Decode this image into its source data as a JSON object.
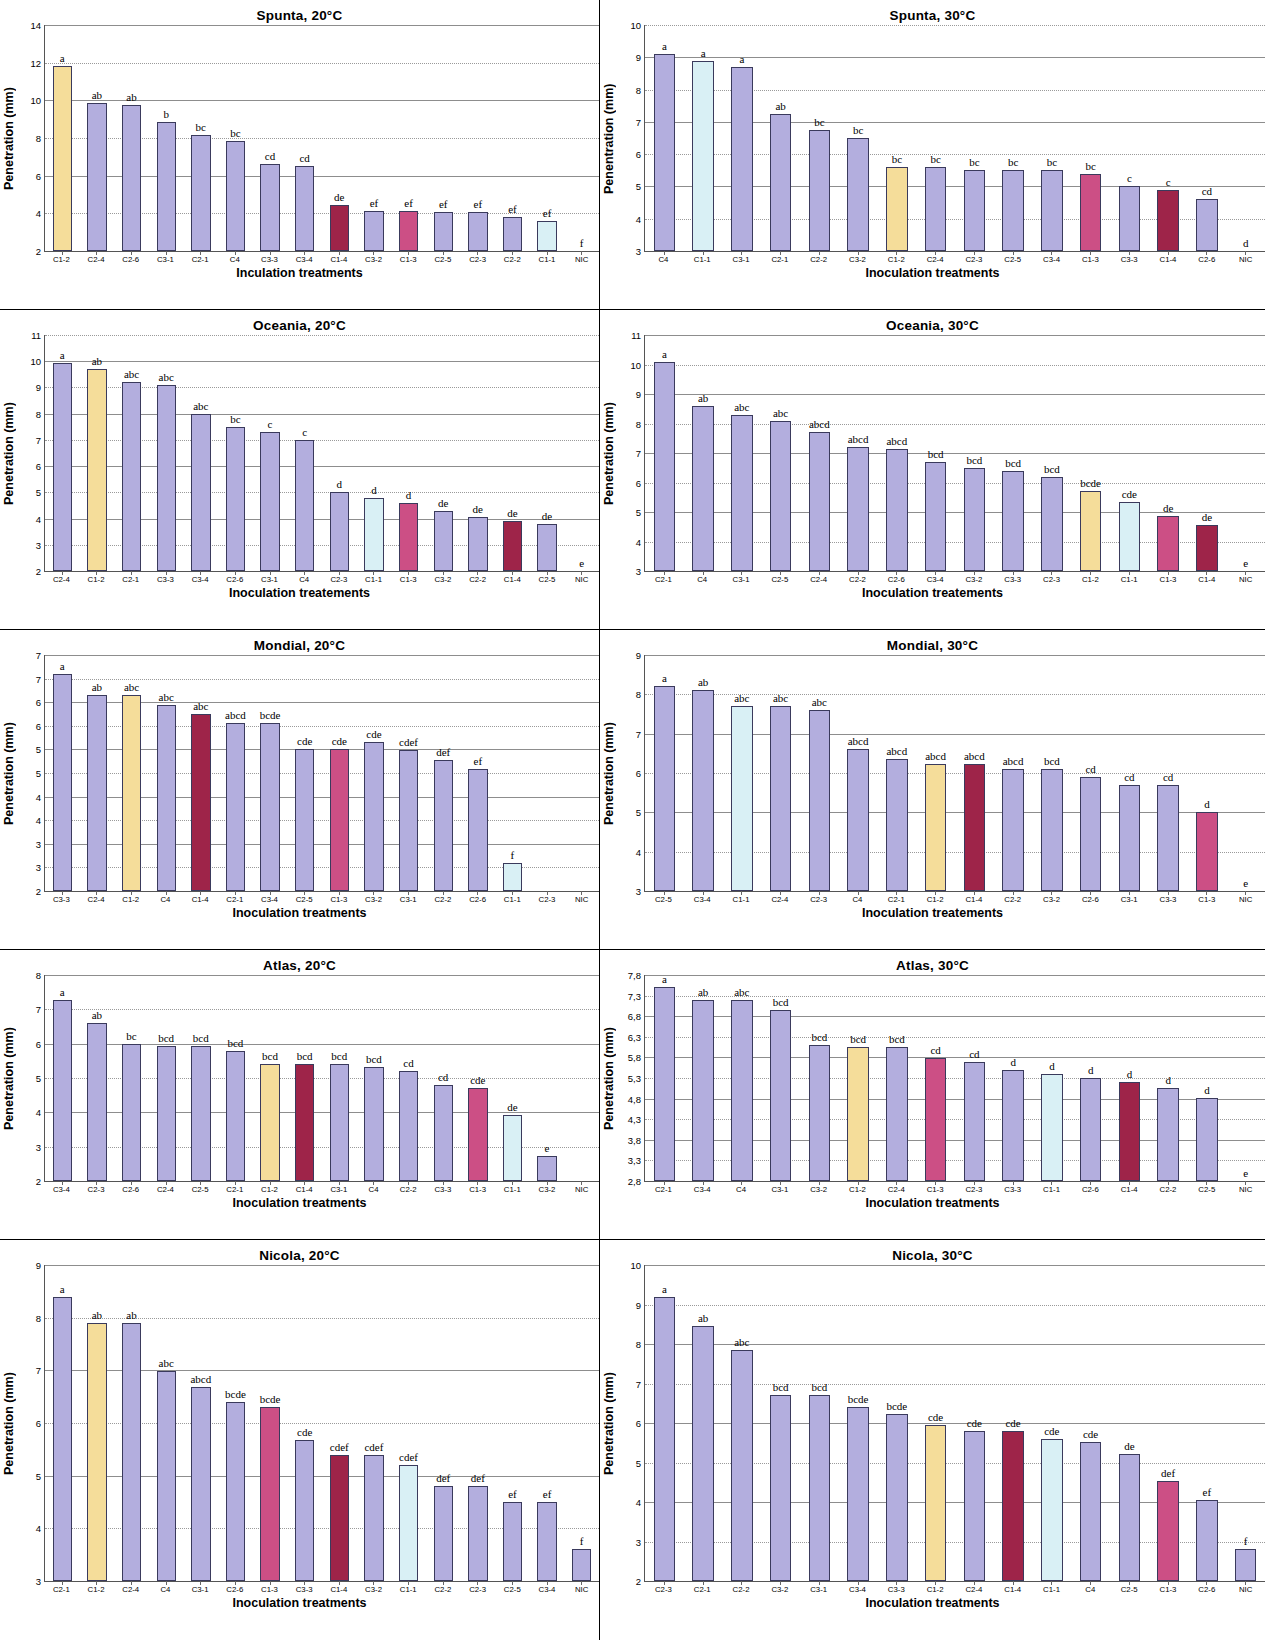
{
  "figure": {
    "xaxis_title_default": "Inoculation treatments",
    "yaxis_title_default": "Penetration (mm)",
    "colors": {
      "default_bar": "#b3aede",
      "yellow_bar": "#f5dd9a",
      "pale_blue_bar": "#d9f0f5",
      "pink_bar": "#cc4f85",
      "dark_red_bar": "#9e2449",
      "bar_border": "#3a3a5c",
      "gridline": "#9a9a9a"
    }
  },
  "chart_data": [
    {
      "id": "spunta-20",
      "type": "bar",
      "title": "Spunta, 20°C",
      "xlabel": "Inculation treatments",
      "ylabel": "Penetration (mm)",
      "ylim": [
        2,
        14
      ],
      "yticks": [
        "2",
        "4",
        "6",
        "8",
        "10",
        "12",
        "14"
      ],
      "ytickvals": [
        2,
        4,
        6,
        8,
        10,
        12,
        14
      ],
      "categories": [
        "C1-2",
        "C2-4",
        "C2-6",
        "C3-1",
        "C2-1",
        "C4",
        "C3-3",
        "C3-4",
        "C1-4",
        "C3-2",
        "C1-3",
        "C2-5",
        "C2-3",
        "C2-2",
        "C1-1",
        "NIC"
      ],
      "values": [
        11.85,
        9.85,
        9.75,
        8.85,
        8.15,
        7.85,
        6.6,
        6.5,
        4.45,
        4.1,
        4.15,
        4.05,
        4.05,
        3.8,
        3.6,
        2.0
      ],
      "labels": [
        "a",
        "ab",
        "ab",
        "b",
        "bc",
        "bc",
        "cd",
        "cd",
        "de",
        "ef",
        "ef",
        "ef",
        "ef",
        "ef",
        "ef",
        "f"
      ],
      "bar_colors": [
        "yellow",
        "default",
        "default",
        "default",
        "default",
        "default",
        "default",
        "default",
        "darkred",
        "default",
        "pink",
        "default",
        "default",
        "default",
        "paleblue",
        "none"
      ]
    },
    {
      "id": "spunta-30",
      "type": "bar",
      "title": "Spunta, 30°C",
      "xlabel": "Inoculation treatments",
      "ylabel": "Penentration (mm)",
      "ylim": [
        3,
        10
      ],
      "yticks": [
        "3",
        "4",
        "5",
        "6",
        "7",
        "8",
        "9",
        "10"
      ],
      "ytickvals": [
        3,
        4,
        5,
        6,
        7,
        8,
        9,
        10
      ],
      "categories": [
        "C4",
        "C1-1",
        "C3-1",
        "C2-1",
        "C2-2",
        "C3-2",
        "C1-2",
        "C2-4",
        "C2-3",
        "C2-5",
        "C3-4",
        "C1-3",
        "C3-3",
        "C1-4",
        "C2-6",
        "NIC"
      ],
      "values": [
        9.1,
        8.9,
        8.7,
        7.25,
        6.75,
        6.5,
        5.6,
        5.6,
        5.5,
        5.5,
        5.5,
        5.4,
        5.0,
        4.9,
        4.6,
        3.0
      ],
      "labels": [
        "a",
        "a",
        "a",
        "ab",
        "bc",
        "bc",
        "bc",
        "bc",
        "bc",
        "bc",
        "bc",
        "bc",
        "c",
        "c",
        "cd",
        "d"
      ],
      "bar_colors": [
        "default",
        "paleblue",
        "default",
        "default",
        "default",
        "default",
        "yellow",
        "default",
        "default",
        "default",
        "default",
        "pink",
        "default",
        "darkred",
        "default",
        "none"
      ]
    },
    {
      "id": "oceania-20",
      "type": "bar",
      "title": "Oceania, 20°C",
      "xlabel": "Inoculation treatements",
      "ylabel": "Penetration (mm)",
      "ylim": [
        2,
        11
      ],
      "yticks": [
        "2",
        "3",
        "4",
        "5",
        "6",
        "7",
        "8",
        "9",
        "10",
        "11"
      ],
      "ytickvals": [
        2,
        3,
        4,
        5,
        6,
        7,
        8,
        9,
        10,
        11
      ],
      "categories": [
        "C2-4",
        "C1-2",
        "C2-1",
        "C3-3",
        "C3-4",
        "C2-6",
        "C3-1",
        "C4",
        "C2-3",
        "C1-1",
        "C1-3",
        "C3-2",
        "C2-2",
        "C1-4",
        "C2-5",
        "NIC"
      ],
      "values": [
        9.95,
        9.7,
        9.2,
        9.1,
        8.0,
        7.5,
        7.3,
        7.0,
        5.0,
        4.8,
        4.6,
        4.3,
        4.05,
        3.9,
        3.8,
        2.0
      ],
      "labels": [
        "a",
        "ab",
        "abc",
        "abc",
        "abc",
        "bc",
        "c",
        "c",
        "d",
        "d",
        "d",
        "de",
        "de",
        "de",
        "de",
        "e"
      ],
      "bar_colors": [
        "default",
        "yellow",
        "default",
        "default",
        "default",
        "default",
        "default",
        "default",
        "default",
        "paleblue",
        "pink",
        "default",
        "default",
        "darkred",
        "default",
        "none"
      ]
    },
    {
      "id": "oceania-30",
      "type": "bar",
      "title": "Oceania, 30°C",
      "xlabel": "Inoculation treatements",
      "ylabel": "Penetration (mm)",
      "ylim": [
        3,
        11
      ],
      "yticks": [
        "3",
        "4",
        "5",
        "6",
        "7",
        "8",
        "9",
        "10",
        "11"
      ],
      "ytickvals": [
        3,
        4,
        5,
        6,
        7,
        8,
        9,
        10,
        11
      ],
      "categories": [
        "C2-1",
        "C4",
        "C3-1",
        "C2-5",
        "C2-4",
        "C2-2",
        "C2-6",
        "C3-4",
        "C3-2",
        "C3-3",
        "C2-3",
        "C1-2",
        "C1-1",
        "C1-3",
        "C1-4",
        "NIC"
      ],
      "values": [
        10.1,
        8.6,
        8.3,
        8.1,
        7.7,
        7.2,
        7.15,
        6.7,
        6.5,
        6.4,
        6.2,
        5.7,
        5.35,
        4.85,
        4.55,
        3.0
      ],
      "labels": [
        "a",
        "ab",
        "abc",
        "abc",
        "abcd",
        "abcd",
        "abcd",
        "bcd",
        "bcd",
        "bcd",
        "bcd",
        "bcde",
        "cde",
        "de",
        "de",
        "e"
      ],
      "bar_colors": [
        "default",
        "default",
        "default",
        "default",
        "default",
        "default",
        "default",
        "default",
        "default",
        "default",
        "default",
        "yellow",
        "paleblue",
        "pink",
        "darkred",
        "none"
      ]
    },
    {
      "id": "mondial-20",
      "type": "bar",
      "title": "Mondial, 20°C",
      "xlabel": "Inoculation treatments",
      "ylabel": "Penetration (mm)",
      "ylim": [
        2,
        7
      ],
      "yticks": [
        "2",
        "3",
        "3",
        "4",
        "4",
        "5",
        "5",
        "6",
        "6",
        "7",
        "7"
      ],
      "ytickvals": [
        2,
        2.5,
        3,
        3.5,
        4,
        4.5,
        5,
        5.5,
        6,
        6.5,
        7
      ],
      "categories": [
        "C3-3",
        "C2-4",
        "C1-2",
        "C4",
        "C1-4",
        "C2-1",
        "C3-4",
        "C2-5",
        "C1-3",
        "C3-2",
        "C3-1",
        "C2-2",
        "C2-6",
        "C1-1",
        "C2-3",
        "NIC"
      ],
      "values": [
        6.6,
        6.15,
        6.15,
        5.95,
        5.75,
        5.55,
        5.55,
        5.0,
        5.0,
        5.15,
        4.98,
        4.78,
        4.58,
        2.6,
        2.0,
        2.0
      ],
      "labels": [
        "a",
        "ab",
        "abc",
        "abc",
        "abc",
        "abcd",
        "bcde",
        "cde",
        "cde",
        "cde",
        "cdef",
        "def",
        "ef",
        "f",
        "",
        ""
      ],
      "bar_colors": [
        "default",
        "default",
        "yellow",
        "default",
        "darkred",
        "default",
        "default",
        "default",
        "pink",
        "default",
        "default",
        "default",
        "default",
        "paleblue",
        "none",
        "none"
      ]
    },
    {
      "id": "mondial-30",
      "type": "bar",
      "title": "Mondial, 30°C",
      "xlabel": "Inoculation treatements",
      "ylabel": "Penetration (mm)",
      "ylim": [
        3,
        9
      ],
      "yticks": [
        "3",
        "4",
        "5",
        "6",
        "7",
        "8",
        "9"
      ],
      "ytickvals": [
        3,
        4,
        5,
        6,
        7,
        8,
        9
      ],
      "categories": [
        "C2-5",
        "C3-4",
        "C1-1",
        "C2-4",
        "C2-3",
        "C4",
        "C2-1",
        "C1-2",
        "C1-4",
        "C2-2",
        "C3-2",
        "C2-6",
        "C3-1",
        "C3-3",
        "C1-3",
        "NIC"
      ],
      "values": [
        8.2,
        8.1,
        7.7,
        7.7,
        7.6,
        6.6,
        6.35,
        6.22,
        6.22,
        6.1,
        6.1,
        5.9,
        5.7,
        5.7,
        5.0,
        3.0
      ],
      "labels": [
        "a",
        "ab",
        "abc",
        "abc",
        "abc",
        "abcd",
        "abcd",
        "abcd",
        "abcd",
        "abcd",
        "bcd",
        "cd",
        "cd",
        "cd",
        "d",
        "e"
      ],
      "bar_colors": [
        "default",
        "default",
        "paleblue",
        "default",
        "default",
        "default",
        "default",
        "yellow",
        "darkred",
        "default",
        "default",
        "default",
        "default",
        "default",
        "pink",
        "none"
      ]
    },
    {
      "id": "atlas-20",
      "type": "bar",
      "title": "Atlas, 20°C",
      "xlabel": "Inoculation treatments",
      "ylabel": "Penetration (mm)",
      "ylim": [
        2,
        8
      ],
      "yticks": [
        "2",
        "3",
        "4",
        "5",
        "6",
        "7",
        "8"
      ],
      "ytickvals": [
        2,
        3,
        4,
        5,
        6,
        7,
        8
      ],
      "categories": [
        "C3-4",
        "C2-3",
        "C2-6",
        "C2-4",
        "C2-5",
        "C2-1",
        "C1-2",
        "C1-4",
        "C3-1",
        "C4",
        "C2-2",
        "C3-3",
        "C1-3",
        "C1-1",
        "C3-2",
        "NIC"
      ],
      "values": [
        7.28,
        6.6,
        6.0,
        5.92,
        5.92,
        5.8,
        5.4,
        5.4,
        5.4,
        5.32,
        5.2,
        4.8,
        4.7,
        3.92,
        2.72,
        2.0
      ],
      "labels": [
        "a",
        "ab",
        "bc",
        "bcd",
        "bcd",
        "bcd",
        "bcd",
        "bcd",
        "bcd",
        "bcd",
        "cd",
        "cd",
        "cde",
        "de",
        "e",
        ""
      ],
      "bar_colors": [
        "default",
        "default",
        "default",
        "default",
        "default",
        "default",
        "yellow",
        "darkred",
        "default",
        "default",
        "default",
        "default",
        "pink",
        "paleblue",
        "default",
        "none"
      ]
    },
    {
      "id": "atlas-30",
      "type": "bar",
      "title": "Atlas, 30°C",
      "xlabel": "Inoculation treatments",
      "ylabel": "Penetration (mm)",
      "ylim": [
        2.8,
        7.8
      ],
      "yticks": [
        "2,8",
        "3,3",
        "3,8",
        "4,3",
        "4,8",
        "5,3",
        "5,8",
        "6,3",
        "6,8",
        "7,3",
        "7,8"
      ],
      "ytickvals": [
        2.8,
        3.3,
        3.8,
        4.3,
        4.8,
        5.3,
        5.8,
        6.3,
        6.8,
        7.3,
        7.8
      ],
      "categories": [
        "C2-1",
        "C3-4",
        "C4",
        "C3-1",
        "C3-2",
        "C1-2",
        "C2-4",
        "C1-3",
        "C2-3",
        "C3-3",
        "C1-1",
        "C2-6",
        "C1-4",
        "C2-2",
        "C2-5",
        "NIC"
      ],
      "values": [
        7.52,
        7.2,
        7.2,
        6.95,
        6.1,
        6.05,
        6.05,
        5.78,
        5.7,
        5.5,
        5.4,
        5.3,
        5.2,
        5.05,
        4.82,
        2.8
      ],
      "labels": [
        "a",
        "ab",
        "abc",
        "bcd",
        "bcd",
        "bcd",
        "bcd",
        "cd",
        "cd",
        "d",
        "d",
        "d",
        "d",
        "d",
        "d",
        "e"
      ],
      "bar_colors": [
        "default",
        "default",
        "default",
        "default",
        "default",
        "yellow",
        "default",
        "pink",
        "default",
        "default",
        "paleblue",
        "default",
        "darkred",
        "default",
        "default",
        "none"
      ]
    },
    {
      "id": "nicola-20",
      "type": "bar",
      "title": "Nicola, 20°C",
      "xlabel": "Inoculation treatments",
      "ylabel": "Penetration (mm)",
      "ylim": [
        3,
        9
      ],
      "yticks": [
        "3",
        "4",
        "5",
        "6",
        "7",
        "8",
        "9"
      ],
      "ytickvals": [
        3,
        4,
        5,
        6,
        7,
        8,
        9
      ],
      "categories": [
        "C2-1",
        "C1-2",
        "C2-4",
        "C4",
        "C3-1",
        "C2-6",
        "C1-3",
        "C3-3",
        "C1-4",
        "C3-2",
        "C1-1",
        "C2-2",
        "C2-3",
        "C2-5",
        "C3-4",
        "NIC"
      ],
      "values": [
        8.4,
        7.9,
        7.9,
        6.98,
        6.68,
        6.4,
        6.3,
        5.67,
        5.4,
        5.4,
        5.2,
        4.8,
        4.8,
        4.5,
        4.5,
        3.6
      ],
      "labels": [
        "a",
        "ab",
        "ab",
        "abc",
        "abcd",
        "bcde",
        "bcde",
        "cde",
        "cdef",
        "cdef",
        "cdef",
        "def",
        "def",
        "ef",
        "ef",
        "f"
      ],
      "bar_colors": [
        "default",
        "yellow",
        "default",
        "default",
        "default",
        "default",
        "pink",
        "default",
        "darkred",
        "default",
        "paleblue",
        "default",
        "default",
        "default",
        "default",
        "default"
      ]
    },
    {
      "id": "nicola-30",
      "type": "bar",
      "title": "Nicola, 30°C",
      "xlabel": "Inoculation treatments",
      "ylabel": "Penetration (mm)",
      "ylim": [
        2,
        10
      ],
      "yticks": [
        "2",
        "3",
        "4",
        "5",
        "6",
        "7",
        "8",
        "9",
        "10"
      ],
      "ytickvals": [
        2,
        3,
        4,
        5,
        6,
        7,
        8,
        9,
        10
      ],
      "categories": [
        "C2-3",
        "C2-1",
        "C2-2",
        "C3-2",
        "C3-1",
        "C3-4",
        "C3-3",
        "C1-2",
        "C2-4",
        "C1-4",
        "C1-1",
        "C4",
        "C2-5",
        "C1-3",
        "C2-6",
        "NIC"
      ],
      "values": [
        9.2,
        8.45,
        7.85,
        6.7,
        6.7,
        6.4,
        6.22,
        5.95,
        5.8,
        5.8,
        5.6,
        5.52,
        5.22,
        4.52,
        4.05,
        2.8
      ],
      "labels": [
        "a",
        "ab",
        "abc",
        "bcd",
        "bcd",
        "bcde",
        "bcde",
        "cde",
        "cde",
        "cde",
        "cde",
        "cde",
        "de",
        "def",
        "ef",
        "f"
      ],
      "bar_colors": [
        "default",
        "default",
        "default",
        "default",
        "default",
        "default",
        "default",
        "yellow",
        "default",
        "darkred",
        "paleblue",
        "default",
        "default",
        "pink",
        "default",
        "default"
      ]
    }
  ]
}
